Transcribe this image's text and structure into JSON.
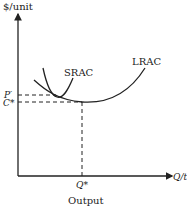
{
  "diagram": {
    "y_axis_label": "$/unit",
    "x_axis_label": "Q/t",
    "x_axis_caption": "Output",
    "curves": [
      {
        "name": "SRAC",
        "label": "SRAC",
        "shape": "U-shaped, tangent to LRAC left of minimum"
      },
      {
        "name": "LRAC",
        "label": "LRAC",
        "shape": "U-shaped long-run average cost"
      }
    ],
    "y_ticks": [
      {
        "label": "P′",
        "meaning": "price at SRAC/LRAC tangency"
      },
      {
        "label": "C*",
        "meaning": "minimum LRAC cost"
      }
    ],
    "x_ticks": [
      {
        "label": "Q*",
        "meaning": "output at minimum LRAC"
      }
    ],
    "colors": {
      "ink": "#222222",
      "background": "#ffffff"
    }
  }
}
